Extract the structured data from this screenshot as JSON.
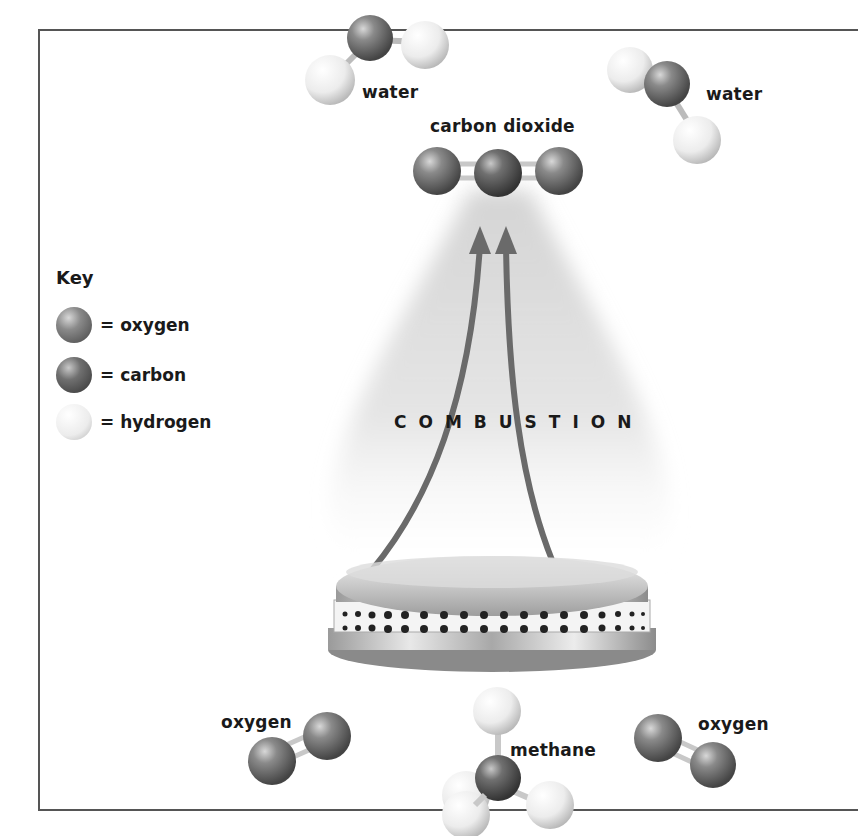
{
  "diagram": {
    "process_label": "COMBUSTION",
    "colors": {
      "oxygen": "#6e6e6e",
      "carbon": "#5a5a5a",
      "hydrogen": "#e6e6e6",
      "arrow": "#6a6a6a",
      "frame": "#555555"
    },
    "molecules": {
      "water_left": {
        "label": "water"
      },
      "water_right": {
        "label": "water"
      },
      "carbon_dioxide": {
        "label": "carbon dioxide"
      },
      "oxygen_left": {
        "label": "oxygen"
      },
      "oxygen_right": {
        "label": "oxygen"
      },
      "methane": {
        "label": "methane"
      }
    },
    "key": {
      "title": "Key",
      "items": [
        {
          "label": "= oxygen",
          "atom": "oxygen"
        },
        {
          "label": "= carbon",
          "atom": "carbon"
        },
        {
          "label": "= hydrogen",
          "atom": "hydrogen"
        }
      ]
    },
    "burner": {
      "label": "gas burner"
    }
  }
}
